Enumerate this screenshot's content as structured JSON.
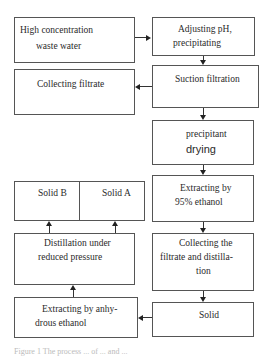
{
  "diagram": {
    "type": "flowchart",
    "nodes": {
      "waste_water": {
        "line1": "High  concentration",
        "line2": "waste  water"
      },
      "adjust_ph": {
        "line1": "Adjusting pH,",
        "line2": "precipitating"
      },
      "suction": {
        "line1": "Suction filtration"
      },
      "collect_filtrate": {
        "line1": "Collecting filtrate"
      },
      "drying": {
        "line1": "precipitant",
        "line2": "drying"
      },
      "extract95": {
        "line1": "Extracting by",
        "line2": "95% ethanol"
      },
      "solid_b": {
        "line1": "Solid B"
      },
      "solid_a": {
        "line1": "Solid A"
      },
      "distill_reduced": {
        "line1": "Distillation under",
        "line2": "reduced pressure"
      },
      "collect_distill": {
        "line1": "Collecting the",
        "line2": "filtrate and distilla-",
        "line3": "tion"
      },
      "extract_anhydrous": {
        "line1": "Extracting by anhy-",
        "line2": "drous ethanol"
      },
      "solid": {
        "line1": "Solid"
      }
    },
    "edges": [
      [
        "waste_water",
        "adjust_ph"
      ],
      [
        "adjust_ph",
        "suction"
      ],
      [
        "suction",
        "collect_filtrate"
      ],
      [
        "suction",
        "drying"
      ],
      [
        "drying",
        "extract95"
      ],
      [
        "extract95",
        "collect_distill"
      ],
      [
        "collect_distill",
        "solid"
      ],
      [
        "solid",
        "extract_anhydrous"
      ],
      [
        "extract_anhydrous",
        "distill_reduced"
      ],
      [
        "distill_reduced",
        "solid_b"
      ],
      [
        "distill_reduced",
        "solid_a"
      ]
    ],
    "caption": "Figure 1   The process ... of ... and ..."
  }
}
